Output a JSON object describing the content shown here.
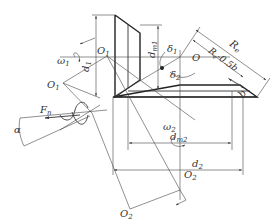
{
  "diagram": {
    "labels": {
      "O1_top": "O",
      "O1_top_sub": "1",
      "O1_left": "O",
      "O1_left_sub": "1",
      "O": "O",
      "O2_right": "O",
      "O2_right_sub": "2",
      "O2_bottom": "O",
      "O2_bottom_sub": "2",
      "omega1": "ω",
      "omega1_sub": "1",
      "omega2": "ω",
      "omega2_sub": "2",
      "d1": "d",
      "d1_sub": "1",
      "dm1": "d",
      "dm1_sub": "m1",
      "dm2": "d",
      "dm2_sub": "m2",
      "d2": "d",
      "d2_sub": "2",
      "delta1": "δ",
      "delta1_sub": "1",
      "delta2": "δ",
      "delta2_sub": "2",
      "Re": "R",
      "Re_sub": "e",
      "Re_minus": "R",
      "Re_minus_sub": "e",
      "Re_minus_tail": "-0.5b",
      "b": "b",
      "Fn": "F",
      "Fn_sub": "n",
      "alpha": "α"
    }
  }
}
